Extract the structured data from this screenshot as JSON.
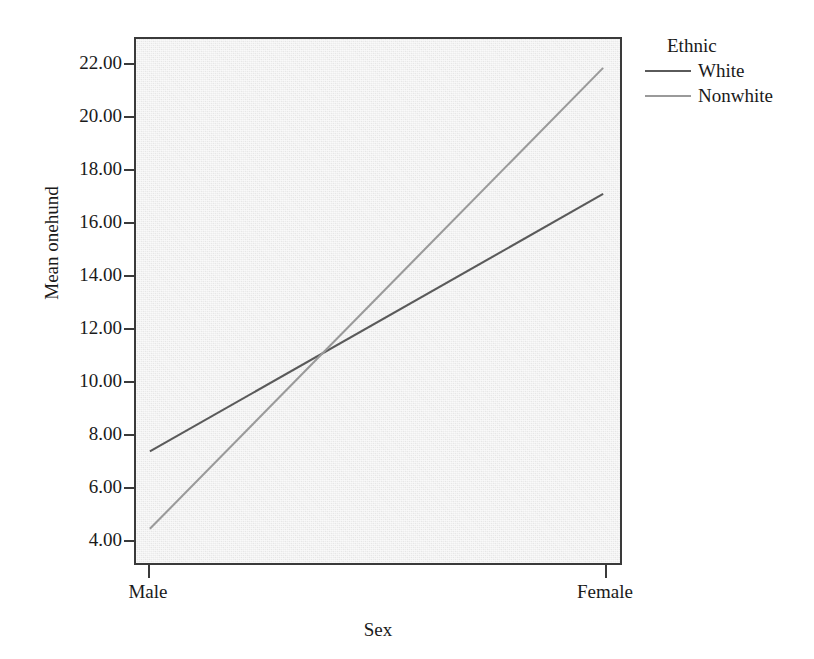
{
  "figure": {
    "background_color": "#ffffff",
    "panel_color": "#ececec",
    "frame_color": "#3a3a3a"
  },
  "legend": {
    "title": "Ethnic",
    "entries": [
      {
        "label": "White",
        "color": "#5a5a5a"
      },
      {
        "label": "Nonwhite",
        "color": "#9a9a9a"
      }
    ]
  },
  "chart_data": {
    "type": "line",
    "title": "",
    "xlabel": "Sex",
    "ylabel": "Mean onehund",
    "categories": [
      "Male",
      "Female"
    ],
    "x": [
      0,
      1
    ],
    "xtick_labels": [
      "Male",
      "Female"
    ],
    "ytick_labels": [
      "4.00",
      "6.00",
      "8.00",
      "10.00",
      "12.00",
      "14.00",
      "16.00",
      "18.00",
      "20.00",
      "22.00"
    ],
    "yticks": [
      4,
      6,
      8,
      10,
      12,
      14,
      16,
      18,
      20,
      22
    ],
    "ylim": [
      3.05,
      23.0
    ],
    "grid": false,
    "legend_position": "right-top",
    "legend_title": "Ethnic",
    "series": [
      {
        "name": "White",
        "values": [
          7.3,
          17.1
        ],
        "color": "#5a5a5a"
      },
      {
        "name": "Nonwhite",
        "values": [
          4.35,
          21.9
        ],
        "color": "#9a9a9a"
      }
    ],
    "annotations": [
      {
        "text": "lines cross near y = 11.0",
        "value": 11.0
      }
    ]
  }
}
